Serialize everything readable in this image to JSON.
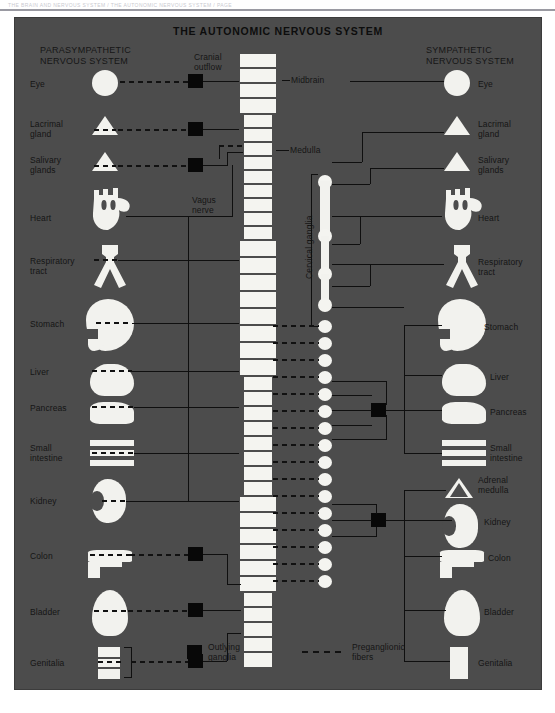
{
  "page": {
    "faint_header": "THE BRAIN AND NERVOUS SYSTEM  /  THE AUTONOMIC NERVOUS SYSTEM  /  PAGE",
    "title": "THE AUTONOMIC NERVOUS SYSTEM",
    "background": "#4c4c4c",
    "organ_color": "#f2f2ee",
    "line_color": "#0f0f0f"
  },
  "columns": {
    "left_heading": "PARASYMPATHETIC\nNERVOUS SYSTEM",
    "right_heading": "SYMPATHETIC\nNERVOUS SYSTEM"
  },
  "center_labels": {
    "cranial_outflow": "Cranial\noutflow",
    "midbrain": "Midbrain",
    "medulla": "Medulla",
    "vagus_nerve": "Vagus\nnerve",
    "cervical_ganglia": "Cervical ganglia"
  },
  "legend": {
    "ganglia_label": "Outlying\nganglia",
    "fibers_label": "Preganglionic\nfibers"
  },
  "left_organs": [
    {
      "label": "Eye",
      "icon": "eye-circle-icon"
    },
    {
      "label": "Lacrimal\ngland",
      "icon": "lacrimal-triangle-icon"
    },
    {
      "label": "Salivary\nglands",
      "icon": "salivary-triangle-icon"
    },
    {
      "label": "Heart",
      "icon": "heart-icon"
    },
    {
      "label": "Respiratory\ntract",
      "icon": "respiratory-tract-icon"
    },
    {
      "label": "Stomach",
      "icon": "stomach-icon"
    },
    {
      "label": "Liver",
      "icon": "liver-icon"
    },
    {
      "label": "Pancreas",
      "icon": "pancreas-icon"
    },
    {
      "label": "Small\nintestine",
      "icon": "small-intestine-icon"
    },
    {
      "label": "Kidney",
      "icon": "kidney-icon"
    },
    {
      "label": "Colon",
      "icon": "colon-icon"
    },
    {
      "label": "Bladder",
      "icon": "bladder-icon"
    },
    {
      "label": "Genitalia",
      "icon": "genitalia-icon"
    }
  ],
  "right_organs": [
    {
      "label": "Eye",
      "icon": "eye-circle-icon"
    },
    {
      "label": "Lacrimal\ngland",
      "icon": "lacrimal-triangle-icon"
    },
    {
      "label": "Salivary\nglands",
      "icon": "salivary-triangle-icon"
    },
    {
      "label": "Heart",
      "icon": "heart-icon"
    },
    {
      "label": "Respiratory\ntract",
      "icon": "respiratory-tract-icon"
    },
    {
      "label": "Stomach",
      "icon": "stomach-icon"
    },
    {
      "label": "Liver",
      "icon": "liver-icon"
    },
    {
      "label": "Pancreas",
      "icon": "pancreas-icon"
    },
    {
      "label": "Small\nintestine",
      "icon": "small-intestine-icon"
    },
    {
      "label": "Adrenal\nmedulla",
      "icon": "adrenal-medulla-icon"
    },
    {
      "label": "Kidney",
      "icon": "kidney-icon"
    },
    {
      "label": "Colon",
      "icon": "colon-icon"
    },
    {
      "label": "Bladder",
      "icon": "bladder-icon"
    },
    {
      "label": "Genitalia",
      "icon": "genitalia-icon"
    }
  ]
}
